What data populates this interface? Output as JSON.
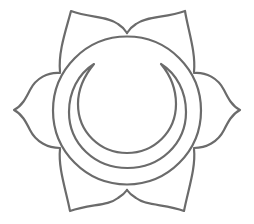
{
  "image": {
    "title": "Sacral chakra (Svadhisthana) line symbol",
    "width": 254,
    "height": 224,
    "background": "#ffffff"
  },
  "symbol": {
    "name": "six-petal lotus with circle and crescent moon",
    "stroke_color": "#6b6b6b",
    "stroke_width": 2.2,
    "petal_count": 6,
    "outer_circle": {
      "cx": 127,
      "cy": 110.5,
      "r": 74
    },
    "crescent": {
      "outer_arc": {
        "cx": 127.5,
        "cy": 110,
        "r": 58
      },
      "inner_arc": {
        "cx": 127,
        "cy": 104,
        "r": 49
      },
      "left_tip": [
        94,
        64
      ],
      "right_tip": [
        161,
        64
      ]
    },
    "petal_tips": {
      "top_left": [
        71,
        11
      ],
      "top_right": [
        185,
        11
      ],
      "right": [
        240,
        110
      ],
      "bottom_right": [
        184,
        211
      ],
      "bottom_left": [
        70,
        211
      ],
      "left": [
        14,
        110
      ]
    }
  }
}
